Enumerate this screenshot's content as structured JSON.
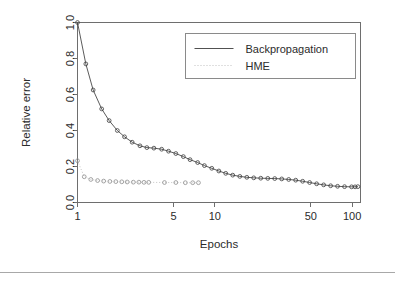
{
  "figure": {
    "name": "relative-error-vs-epochs-plot"
  },
  "axes": {
    "x": {
      "title": "Epochs",
      "scale": "log10",
      "tick_labels": [
        "1",
        "5",
        "10",
        "50",
        "100"
      ],
      "tick_values": [
        1,
        5,
        10,
        50,
        100
      ],
      "range": [
        1,
        115
      ]
    },
    "y": {
      "title": "Relative error",
      "scale": "linear",
      "tick_labels": [
        "0.0",
        "0.2",
        "0.4",
        "0.6",
        "0.8",
        "1.0"
      ],
      "tick_values": [
        0.0,
        0.2,
        0.4,
        0.6,
        0.8,
        1.0
      ],
      "range": [
        0.0,
        1.0
      ]
    }
  },
  "legend": {
    "entries": [
      {
        "label": "Backpropagation",
        "style": "solid",
        "color": "#3d3d3d"
      },
      {
        "label": "HME",
        "style": "dotted",
        "color": "#b9b9b9"
      }
    ]
  },
  "colors": {
    "backpropagation": "#3d3d3d",
    "hme": "#b9b9b9",
    "frame": "#6e6e6e",
    "text": "#2b2b2b",
    "rule": "#a8a8a8"
  },
  "chart_data": {
    "type": "line",
    "title": "",
    "subtitle": "",
    "xlabel": "Epochs",
    "ylabel": "Relative error",
    "xscale": "log",
    "xlim": [
      1,
      115
    ],
    "ylim": [
      0.0,
      1.0
    ],
    "grid": false,
    "legend_position": "top-right",
    "series": [
      {
        "name": "Backpropagation",
        "style": "solid",
        "marker": "open-circle",
        "x": [
          1,
          1.15,
          1.3,
          1.5,
          1.7,
          1.95,
          2.2,
          2.5,
          2.85,
          3.2,
          3.6,
          4.1,
          4.6,
          5.2,
          5.9,
          6.6,
          7.5,
          8.4,
          9.5,
          10.7,
          12,
          13.5,
          15.2,
          17.1,
          19.2,
          21.6,
          24.3,
          27.3,
          30.7,
          34.5,
          38.8,
          43.6,
          49,
          55.1,
          62,
          69.7,
          78.3,
          88,
          99,
          105,
          110
        ],
        "y": [
          1.0,
          0.77,
          0.625,
          0.52,
          0.455,
          0.4,
          0.365,
          0.335,
          0.315,
          0.305,
          0.302,
          0.296,
          0.285,
          0.272,
          0.255,
          0.238,
          0.222,
          0.205,
          0.19,
          0.175,
          0.162,
          0.152,
          0.145,
          0.14,
          0.137,
          0.135,
          0.134,
          0.133,
          0.131,
          0.128,
          0.124,
          0.118,
          0.111,
          0.104,
          0.098,
          0.093,
          0.09,
          0.088,
          0.087,
          0.087,
          0.088
        ]
      },
      {
        "name": "HME",
        "style": "dotted",
        "marker": "open-circle",
        "x": [
          1,
          1.12,
          1.25,
          1.4,
          1.55,
          1.72,
          1.9,
          2.1,
          2.3,
          2.55,
          2.8,
          3.05,
          3.3,
          4.3,
          5.2,
          6.1,
          6.9,
          7.6
        ],
        "y": [
          0.232,
          0.143,
          0.128,
          0.122,
          0.119,
          0.117,
          0.116,
          0.115,
          0.114,
          0.113,
          0.113,
          0.112,
          0.112,
          0.111,
          0.111,
          0.11,
          0.11,
          0.11
        ]
      }
    ]
  }
}
